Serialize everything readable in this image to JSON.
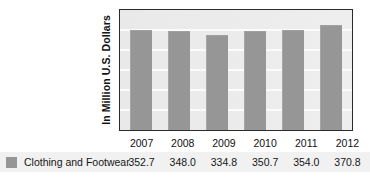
{
  "chart_data": {
    "type": "bar",
    "title": "",
    "subtitle": "",
    "xlabel": "",
    "ylabel": "In Million U.S. Dollars",
    "categories": [
      "2007",
      "2008",
      "2009",
      "2010",
      "2011",
      "2012"
    ],
    "series": [
      {
        "name": "Clothing and Footwear",
        "values": [
          352.7,
          348.0,
          334.8,
          350.7,
          354.0,
          370.8
        ],
        "color": "#969696"
      }
    ],
    "value_labels": [
      "352.7",
      "348.0",
      "334.8",
      "350.7",
      "354.0",
      "370.8"
    ],
    "ylim": [
      0,
      420
    ],
    "grid": true,
    "gridlines": 5,
    "legend_position": "left-row",
    "plot_background": "#ececec",
    "gridline_color": "#fbfbfb",
    "border_color": "#2b2b2b"
  },
  "legend": {
    "swatch_color": "#969696",
    "label": "Clothing and Footwear"
  }
}
